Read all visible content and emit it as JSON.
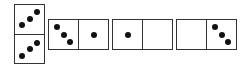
{
  "dominoes": [
    {
      "orientation": "vertical",
      "halves": [
        3,
        3
      ],
      "pip_pattern": "diagonal-up"
    },
    {
      "orientation": "horizontal",
      "halves": [
        3,
        1
      ],
      "pip_pattern": "diagonal-down"
    },
    {
      "orientation": "horizontal",
      "halves": [
        1,
        0
      ]
    },
    {
      "orientation": "horizontal",
      "halves": [
        0,
        3
      ],
      "pip_pattern": "diagonal-down"
    }
  ],
  "colors": {
    "border": "#333333",
    "pip": "#111111",
    "background": "#ffffff"
  }
}
